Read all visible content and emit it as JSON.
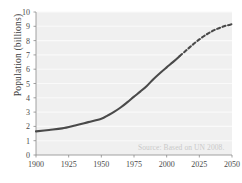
{
  "chart_data": {
    "type": "line",
    "title": "",
    "subtitle": "",
    "xlabel": "",
    "ylabel": "Population (billions)",
    "xlim": [
      1900,
      2050
    ],
    "ylim": [
      0,
      10
    ],
    "grid": "horizontal",
    "legend": "none",
    "annotation": "Source: Based on UN 2008.",
    "xticks": [
      1900,
      1925,
      1950,
      1975,
      2000,
      2025,
      2050
    ],
    "yticks": [
      0,
      1,
      2,
      3,
      4,
      5,
      6,
      7,
      8,
      9,
      10
    ],
    "series": [
      {
        "name": "Historical population",
        "style": "solid",
        "color": "#4a4a4a",
        "x": [
          1900,
          1910,
          1920,
          1930,
          1940,
          1950,
          1955,
          1960,
          1965,
          1970,
          1975,
          1980,
          1985,
          1990,
          1995,
          2000,
          2005,
          2010
        ],
        "values": [
          1.65,
          1.75,
          1.86,
          2.07,
          2.3,
          2.53,
          2.77,
          3.03,
          3.34,
          3.7,
          4.08,
          4.45,
          4.85,
          5.32,
          5.74,
          6.13,
          6.51,
          6.92
        ]
      },
      {
        "name": "Projected population",
        "style": "dashed",
        "color": "#4a4a4a",
        "x": [
          2010,
          2015,
          2020,
          2025,
          2030,
          2035,
          2040,
          2045,
          2050
        ],
        "values": [
          6.92,
          7.32,
          7.72,
          8.08,
          8.4,
          8.67,
          8.87,
          9.03,
          9.15
        ]
      }
    ]
  },
  "axis": {
    "ylabel": "Population (billions)",
    "ytick_labels": [
      "10",
      "9",
      "8",
      "7",
      "6",
      "5",
      "4",
      "3",
      "2",
      "1",
      "0"
    ],
    "xtick_labels": [
      "1900",
      "1925",
      "1950",
      "1975",
      "2000",
      "2025",
      "2050"
    ]
  },
  "annotations": {
    "source": "Source: Based on UN 2008."
  },
  "colors": {
    "plot_background": "#f0f0f0",
    "gridline": "#fafafa",
    "line": "#4a4a4a",
    "tick_text": "#4a4a4a",
    "source_text": "#c9c9c9",
    "page_background": "#ffffff"
  }
}
